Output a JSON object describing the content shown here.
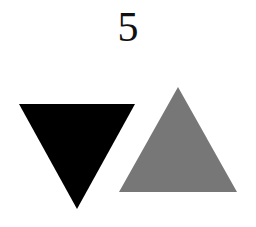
{
  "number_label": "5",
  "shapes": [
    {
      "name": "inverted-triangle",
      "color": "#000000"
    },
    {
      "name": "upright-triangle",
      "color": "#777777"
    }
  ]
}
